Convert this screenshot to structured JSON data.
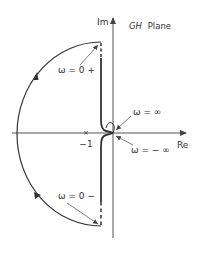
{
  "diagram": {
    "title": "GH Plane",
    "title_italic_part": "GH",
    "title_plain_part": "Plane",
    "axes": {
      "imag_label": "Im",
      "real_label": "Re"
    },
    "critical_point": {
      "label": "−1",
      "marker": "×"
    },
    "annotations": {
      "omega_zero_plus": "ω = 0 +",
      "omega_zero_minus": "ω = 0 −",
      "omega_inf": "ω = ∞",
      "omega_neg_inf": "ω = − ∞"
    },
    "colors": {
      "curve": "#333333",
      "axis": "#555555",
      "text": "#333333"
    }
  }
}
